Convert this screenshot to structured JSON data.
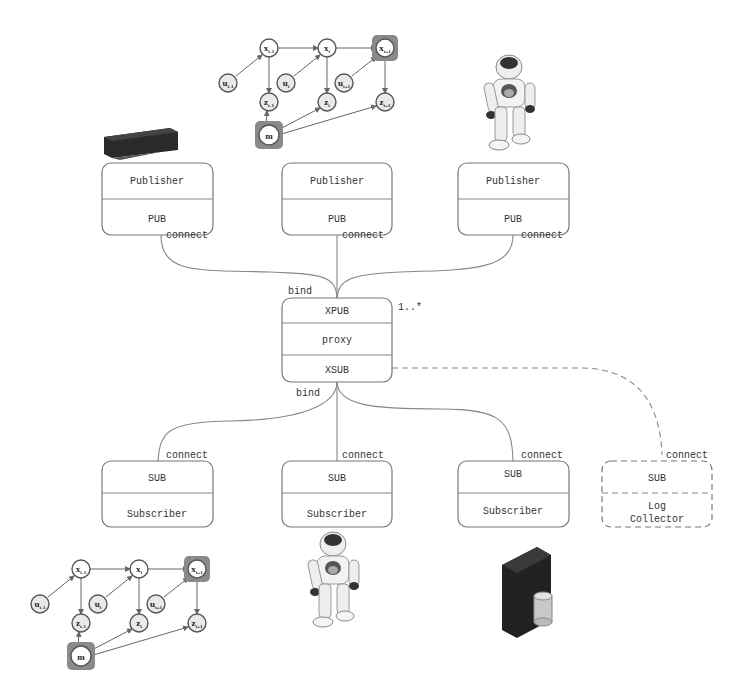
{
  "publishers": [
    {
      "title": "Publisher",
      "socket": "PUB",
      "edge_label": "connect",
      "source_icon": "depth-sensor"
    },
    {
      "title": "Publisher",
      "socket": "PUB",
      "edge_label": "connect",
      "source_icon": "bayesian-network"
    },
    {
      "title": "Publisher",
      "socket": "PUB",
      "edge_label": "connect",
      "source_icon": "humanoid-robot"
    }
  ],
  "proxy": {
    "top_socket": "XPUB",
    "middle": "proxy",
    "bottom_socket": "XSUB",
    "top_edge_label": "bind",
    "bottom_edge_label": "bind",
    "multiplicity": "1..*"
  },
  "subscribers": [
    {
      "socket": "SUB",
      "title": "Subscriber",
      "edge_label": "connect",
      "target_icon": "bayesian-network"
    },
    {
      "socket": "SUB",
      "title": "Subscriber",
      "edge_label": "connect",
      "target_icon": "humanoid-robot"
    },
    {
      "socket": "SUB",
      "title": "Subscriber",
      "edge_label": "connect",
      "target_icon": "database-server"
    },
    {
      "socket": "SUB",
      "title_line1": "Log",
      "title_line2": "Collector",
      "edge_label": "connect",
      "style": "dashed"
    }
  ],
  "graph_nodes": {
    "x_prev": "x",
    "x_prev_sub": "t-1",
    "x_cur": "x",
    "x_cur_sub": "t",
    "x_next": "x",
    "x_next_sub": "t+1",
    "u_prev": "u",
    "u_prev_sub": "t-1",
    "u_cur": "u",
    "u_cur_sub": "t",
    "u_next": "u",
    "u_next_sub": "t+1",
    "z_prev": "z",
    "z_prev_sub": "t-1",
    "z_cur": "z",
    "z_cur_sub": "t",
    "z_next": "z",
    "z_next_sub": "t+1",
    "m": "m"
  },
  "colors": {
    "box_stroke": "#777777",
    "text": "#333333",
    "highlight": "#8a8a8a",
    "node_fill": "#e9e9e9"
  }
}
